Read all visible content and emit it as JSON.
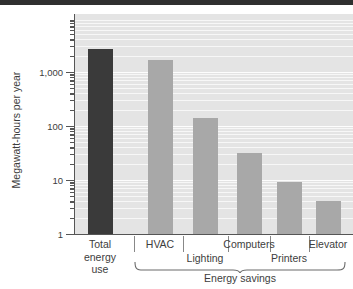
{
  "chart_data": {
    "type": "bar",
    "title": "",
    "subtitle": "",
    "xlabel": "Energy savings",
    "ylabel": "Megawatt-hours per year",
    "yscale": "log",
    "ylim": [
      1,
      4000
    ],
    "grid": true,
    "legend_position": "none",
    "categories": [
      "Total energy use",
      "HVAC",
      "Lighting",
      "Computers",
      "Printers",
      "Elevator"
    ],
    "values": [
      2700,
      1700,
      140,
      31,
      9,
      4
    ],
    "bar_colors": [
      "#3a3a3a",
      "#a8a8a8",
      "#a8a8a8",
      "#a8a8a8",
      "#a8a8a8",
      "#a8a8a8"
    ],
    "ytick_labels": [
      "1",
      "10",
      "100",
      "1,000"
    ],
    "ytick_values": [
      1,
      10,
      100,
      1000
    ],
    "annotations": [
      {
        "text": "Energy savings",
        "covers": [
          "HVAC",
          "Lighting",
          "Computers",
          "Printers",
          "Elevator"
        ],
        "style": "brace"
      }
    ],
    "series": [
      {
        "name": "Energy",
        "points": [
          {
            "category": "Total energy use",
            "value": 2700,
            "color": "#3a3a3a"
          },
          {
            "category": "HVAC",
            "value": 1700,
            "color": "#a8a8a8"
          },
          {
            "category": "Lighting",
            "value": 140,
            "color": "#a8a8a8"
          },
          {
            "category": "Computers",
            "value": 31,
            "color": "#a8a8a8"
          },
          {
            "category": "Printers",
            "value": 9,
            "color": "#a8a8a8"
          },
          {
            "category": "Elevator",
            "value": 4,
            "color": "#a8a8a8"
          }
        ]
      }
    ]
  },
  "axis": {
    "y_title": "Megawatt-hours per year",
    "ticks": [
      {
        "label": "1"
      },
      {
        "label": "10"
      },
      {
        "label": "100"
      },
      {
        "label": "1,000"
      }
    ]
  },
  "xaxis": {
    "labels": [
      {
        "line1": "Total",
        "line2": "energy",
        "line3": "use"
      },
      {
        "line1": "HVAC"
      },
      {
        "line1": "Lighting"
      },
      {
        "line1": "Computers"
      },
      {
        "line1": "Printers"
      },
      {
        "line1": "Elevator"
      }
    ],
    "group_label": "Energy savings"
  },
  "colors": {
    "bar_dark": "#3a3a3a",
    "bar_gray": "#a8a8a8",
    "plot_background": "#e4e4e4",
    "axis": "#555555",
    "text": "#3d3d3d",
    "top_band": "#2f2f2f"
  }
}
